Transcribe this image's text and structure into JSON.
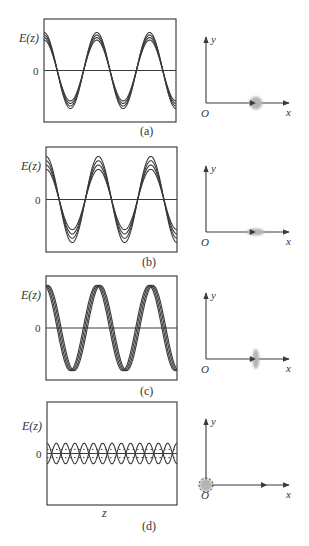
{
  "figure": {
    "panels": [
      {
        "id": "a",
        "caption": "(a)",
        "ylabel": "E(z)",
        "zero_label": "0",
        "xlabel": "",
        "waveform": {
          "cycles": 2.5,
          "amplitudes": [
            0.72,
            0.78,
            0.84,
            0.9
          ],
          "phase_offsets_deg": [
            0,
            0,
            0,
            0
          ],
          "style": "in-phase, small amplitude spread"
        },
        "axes": {
          "x_label": "x",
          "y_label": "y",
          "origin_label": "O"
        },
        "beam_spot": {
          "shape": "circle",
          "position": 0.6,
          "description": "round spot on x axis"
        }
      },
      {
        "id": "b",
        "caption": "(b)",
        "ylabel": "E(z)",
        "zero_label": "0",
        "xlabel": "",
        "waveform": {
          "cycles": 2.5,
          "amplitudes": [
            0.7,
            0.8,
            0.9,
            1.0
          ],
          "phase_offsets_deg": [
            0,
            0,
            0,
            0
          ],
          "style": "in-phase, larger amplitude spread"
        },
        "axes": {
          "x_label": "x",
          "y_label": "y",
          "origin_label": "O"
        },
        "beam_spot": {
          "shape": "ellipse-horizontal",
          "position": 0.6,
          "description": "spot elongated along x"
        }
      },
      {
        "id": "c",
        "caption": "(c)",
        "ylabel": "E(z)",
        "zero_label": "0",
        "xlabel": "",
        "waveform": {
          "cycles": 2.5,
          "amplitudes": [
            1.0,
            1.0,
            1.0,
            1.0
          ],
          "phase_offsets_deg": [
            -14,
            -5,
            5,
            14
          ],
          "style": "equal amplitude, phase spread"
        },
        "axes": {
          "x_label": "x",
          "y_label": "y",
          "origin_label": "O"
        },
        "beam_spot": {
          "shape": "ellipse-vertical",
          "position": 0.6,
          "description": "spot elongated along y"
        }
      },
      {
        "id": "d",
        "caption": "(d)",
        "ylabel": "E(z)",
        "zero_label": "0",
        "xlabel": "z",
        "waveform": {
          "cycles": 7,
          "amplitudes": [
            0.2,
            -0.2
          ],
          "phase_offsets_deg": [
            0,
            0
          ],
          "style": "small oscillation about zero, dotted inner lines"
        },
        "axes": {
          "x_label": "x",
          "y_label": "y",
          "origin_label": "O"
        },
        "beam_spot": {
          "shape": "circle-dashed-at-origin",
          "position": 0,
          "description": "spot centered at origin, dashed outline"
        }
      }
    ],
    "colors": {
      "line": "#3a3a3a",
      "spot": "#b5b5b5",
      "frame": "#444444"
    }
  }
}
